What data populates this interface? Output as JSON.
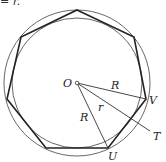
{
  "caption_fragment": "= r.",
  "diagram": {
    "type": "regular heptagon with circumscribed and inscribed circles",
    "center": {
      "label": "O",
      "x": 77,
      "y": 83
    },
    "outer_circle_radius": 73,
    "inner_circle_radius": 65,
    "sides": 7,
    "labels": {
      "center": "O",
      "vertex_v": "V",
      "vertex_u": "U",
      "tangent_point": "T",
      "circumradius_1": "R",
      "circumradius_2": "R",
      "inradius": "r"
    },
    "colors": {
      "polygon": "#222222",
      "circles": "#555555",
      "lines": "#333333"
    }
  }
}
